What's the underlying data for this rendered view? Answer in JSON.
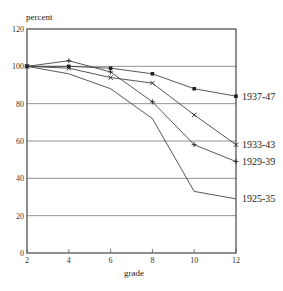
{
  "chart_data": {
    "type": "line",
    "title": "",
    "ylabel": "percent",
    "xlabel": "grade",
    "x": [
      2,
      4,
      6,
      8,
      10,
      12
    ],
    "xlim": [
      2,
      12
    ],
    "ylim": [
      0,
      120
    ],
    "x_ticks": [
      2,
      4,
      6,
      8,
      10,
      12
    ],
    "y_ticks": [
      0,
      20,
      40,
      60,
      80,
      100,
      120
    ],
    "grid": "horizontal",
    "legend_position": "inline labels at right end of each series",
    "series": [
      {
        "name": "1937-47",
        "marker": "square",
        "values": [
          100,
          100,
          99,
          96,
          88,
          84
        ]
      },
      {
        "name": "1933-43",
        "marker": "x",
        "values": [
          100,
          99,
          94,
          91,
          74,
          58
        ]
      },
      {
        "name": "1929-39",
        "marker": "plus",
        "values": [
          100,
          103,
          97,
          81,
          58,
          49
        ]
      },
      {
        "name": "1925-35",
        "marker": "none",
        "values": [
          100,
          96,
          88,
          72,
          33,
          29
        ]
      }
    ]
  }
}
